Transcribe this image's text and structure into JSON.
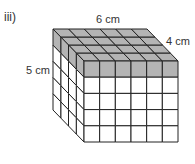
{
  "diagram": {
    "part_label": "iii)",
    "type": "cuboid-of-unit-cubes",
    "dimensions": {
      "width": {
        "value": 6,
        "unit": "cm",
        "label": "6 cm"
      },
      "depth": {
        "value": 4,
        "unit": "cm",
        "label": "4 cm"
      },
      "height": {
        "value": 5,
        "unit": "cm",
        "label": "5 cm"
      }
    },
    "shaded_layer": "top",
    "colors": {
      "shaded": "#b4b4b4",
      "face": "#ffffff",
      "line": "#222222"
    }
  }
}
